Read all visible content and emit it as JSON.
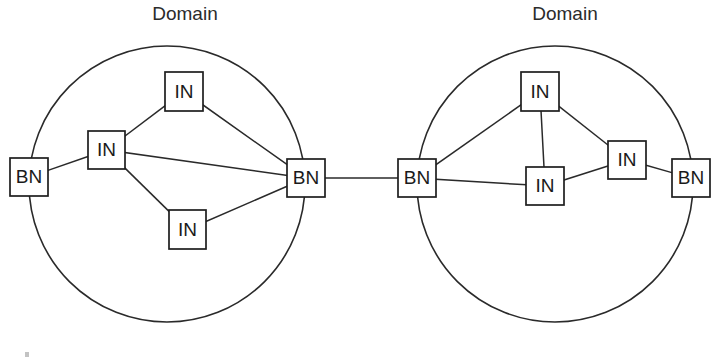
{
  "figure": {
    "width": 715,
    "height": 363,
    "background": "#ffffff",
    "stroke_color": "#2a2a2a",
    "node_stroke_color": "#1e1e1e",
    "node_fill": "#ffffff",
    "text_color": "#1a1a1a"
  },
  "labels": {
    "domain_left": "Domain",
    "domain_right": "Domain",
    "border_node": "BN",
    "internal_node": "IN"
  },
  "chart_data": {
    "type": "diagram",
    "title": "",
    "domains": [
      {
        "id": "domain-left",
        "title": "Domain",
        "title_x": 185,
        "title_y": 15,
        "circle": {
          "cx": 167,
          "cy": 184,
          "r": 138
        },
        "nodes": [
          {
            "id": "L-BN-1",
            "label": "BN",
            "type": "BN",
            "x": 10,
            "y": 158,
            "w": 38,
            "h": 38
          },
          {
            "id": "L-IN-1",
            "label": "IN",
            "type": "IN",
            "x": 88,
            "y": 131,
            "w": 37,
            "h": 38
          },
          {
            "id": "L-IN-2",
            "label": "IN",
            "type": "IN",
            "x": 165,
            "y": 72,
            "w": 38,
            "h": 39
          },
          {
            "id": "L-IN-3",
            "label": "IN",
            "type": "IN",
            "x": 169,
            "y": 210,
            "w": 37,
            "h": 39
          },
          {
            "id": "L-BN-2",
            "label": "BN",
            "type": "BN",
            "x": 287,
            "y": 159,
            "w": 38,
            "h": 38
          }
        ],
        "links": [
          {
            "from": "L-BN-1",
            "to": "L-IN-1"
          },
          {
            "from": "L-IN-1",
            "to": "L-IN-2"
          },
          {
            "from": "L-IN-2",
            "to": "L-BN-2"
          },
          {
            "from": "L-IN-1",
            "to": "L-BN-2"
          },
          {
            "from": "L-IN-1",
            "to": "L-IN-3"
          },
          {
            "from": "L-IN-3",
            "to": "L-BN-2"
          }
        ]
      },
      {
        "id": "domain-right",
        "title": "Domain",
        "title_x": 565,
        "title_y": 15,
        "circle": {
          "cx": 555,
          "cy": 184,
          "r": 138
        },
        "nodes": [
          {
            "id": "R-BN-1",
            "label": "BN",
            "type": "BN",
            "x": 398,
            "y": 159,
            "w": 38,
            "h": 38
          },
          {
            "id": "R-IN-1",
            "label": "IN",
            "type": "IN",
            "x": 521,
            "y": 72,
            "w": 38,
            "h": 39
          },
          {
            "id": "R-IN-2",
            "label": "IN",
            "type": "IN",
            "x": 526,
            "y": 167,
            "w": 38,
            "h": 38
          },
          {
            "id": "R-IN-3",
            "label": "IN",
            "type": "IN",
            "x": 608,
            "y": 141,
            "w": 38,
            "h": 38
          },
          {
            "id": "R-BN-2",
            "label": "BN",
            "type": "BN",
            "x": 672,
            "y": 159,
            "w": 38,
            "h": 38
          }
        ],
        "links": [
          {
            "from": "R-BN-1",
            "to": "R-IN-1"
          },
          {
            "from": "R-BN-1",
            "to": "R-IN-2"
          },
          {
            "from": "R-IN-1",
            "to": "R-IN-2"
          },
          {
            "from": "R-IN-1",
            "to": "R-IN-3"
          },
          {
            "from": "R-IN-2",
            "to": "R-IN-3"
          },
          {
            "from": "R-IN-3",
            "to": "R-BN-2"
          }
        ]
      }
    ],
    "interdomain_links": [
      {
        "id": "interdomain-link",
        "from": "L-BN-2",
        "to": "R-BN-1",
        "x1": 325,
        "y1": 178,
        "x2": 398,
        "y2": 178
      }
    ]
  }
}
